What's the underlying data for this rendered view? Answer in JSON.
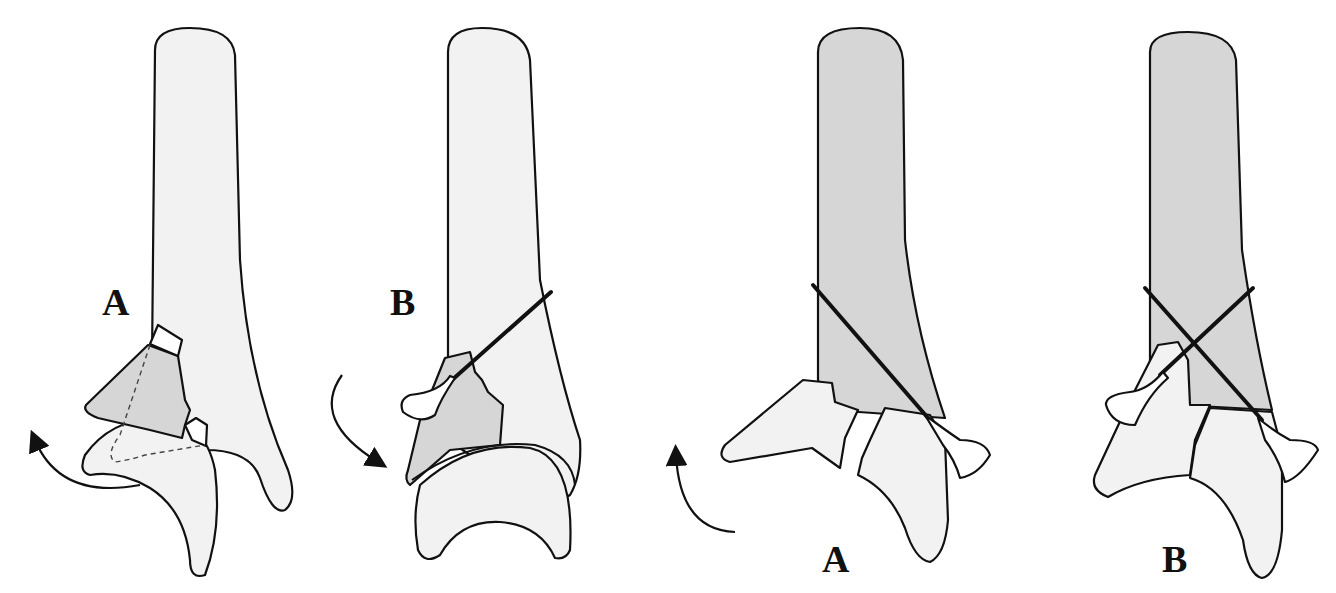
{
  "figure": {
    "colors": {
      "background": "#ffffff",
      "bone_light": "#f2f2f2",
      "bone_shaded": "#d6d6d6",
      "outline": "#111111",
      "wire": "#111111"
    },
    "panels": [
      {
        "id": "panel-1",
        "label": "A",
        "shaft_shade": "light",
        "fragment_shaded": true,
        "wires": 0,
        "arrow": "counterclockwise-up"
      },
      {
        "id": "panel-2",
        "label": "B",
        "shaft_shade": "light",
        "fragment_shaded": true,
        "wires": 1,
        "arrow": "clockwise-down"
      },
      {
        "id": "panel-3",
        "label": "A",
        "shaft_shade": "shaded",
        "fragment_shaded": false,
        "wires": 1,
        "arrow": "counterclockwise-up"
      },
      {
        "id": "panel-4",
        "label": "B",
        "shaft_shade": "shaded",
        "fragment_shaded": false,
        "wires": 2,
        "arrow": "none"
      }
    ]
  }
}
